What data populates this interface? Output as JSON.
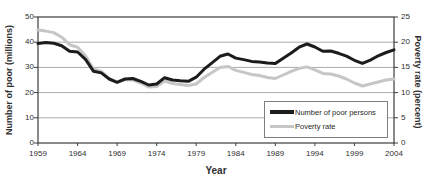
{
  "figure": {
    "clipped_title": "Figure 3-1. Number of poor persons and poverty rate: 1959 to 2004"
  },
  "chart_data": {
    "type": "line",
    "title": "Figure 3-1. Number of poor persons and poverty rate: 1959 to 2004",
    "xlabel": "Year",
    "ylabel_left": "Number of poor (millions)",
    "ylabel_right": "Poverty rate (percent)",
    "xlim": [
      1959,
      2004
    ],
    "ylim_left": [
      0,
      50
    ],
    "ylim_right": [
      0,
      25
    ],
    "xticks": [
      1959,
      1964,
      1969,
      1974,
      1979,
      1984,
      1989,
      1994,
      1999,
      2004
    ],
    "yticks_left": [
      0,
      10,
      20,
      30,
      40,
      50
    ],
    "yticks_right": [
      0,
      5,
      10,
      15,
      20,
      25
    ],
    "grid": "horizontal-gridlines-on",
    "legend_position": "inside-lower-right",
    "x": [
      1959,
      1960,
      1961,
      1962,
      1963,
      1964,
      1965,
      1966,
      1967,
      1968,
      1969,
      1970,
      1971,
      1972,
      1973,
      1974,
      1975,
      1976,
      1977,
      1978,
      1979,
      1980,
      1981,
      1982,
      1983,
      1984,
      1985,
      1986,
      1987,
      1988,
      1989,
      1990,
      1991,
      1992,
      1993,
      1994,
      1995,
      1996,
      1997,
      1998,
      1999,
      2000,
      2001,
      2002,
      2003,
      2004
    ],
    "series": [
      {
        "name": "Number of poor persons",
        "axis": "left",
        "color": "#1c1c1c",
        "stroke_width": 3,
        "values": [
          39.5,
          39.9,
          39.6,
          38.6,
          36.4,
          36.1,
          33.2,
          28.5,
          27.8,
          25.4,
          24.1,
          25.4,
          25.6,
          24.5,
          23.0,
          23.4,
          25.9,
          25.0,
          24.7,
          24.5,
          26.1,
          29.3,
          31.8,
          34.4,
          35.3,
          33.7,
          33.1,
          32.4,
          32.2,
          31.7,
          31.5,
          33.6,
          35.7,
          38.0,
          39.3,
          38.1,
          36.4,
          36.5,
          35.6,
          34.5,
          32.8,
          31.6,
          32.9,
          34.6,
          35.9,
          37.0
        ]
      },
      {
        "name": "Poverty rate",
        "axis": "right",
        "color": "#c6c6c6",
        "stroke_width": 3,
        "values": [
          22.4,
          22.2,
          21.9,
          21.0,
          19.5,
          19.0,
          17.3,
          14.7,
          14.2,
          12.8,
          12.1,
          12.6,
          12.5,
          11.9,
          11.1,
          11.2,
          12.3,
          11.8,
          11.6,
          11.4,
          11.7,
          13.0,
          14.0,
          15.0,
          15.2,
          14.4,
          14.0,
          13.6,
          13.4,
          13.0,
          12.8,
          13.5,
          14.2,
          14.8,
          15.1,
          14.5,
          13.8,
          13.7,
          13.3,
          12.7,
          11.9,
          11.3,
          11.7,
          12.1,
          12.5,
          12.7
        ]
      }
    ],
    "colors": {
      "frame": "#3d3d3d",
      "gridline": "#ababab",
      "background": "#ffffff"
    }
  }
}
